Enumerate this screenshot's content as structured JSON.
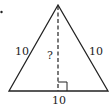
{
  "diagram": {
    "type": "isosceles-triangle-height",
    "labels": {
      "left_side": "10",
      "right_side": "10",
      "base": "10",
      "height": "?"
    },
    "marker": "•",
    "colors": {
      "stroke": "#222222",
      "background": "#ffffff"
    }
  }
}
